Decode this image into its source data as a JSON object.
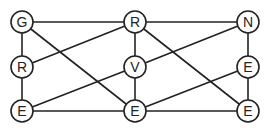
{
  "diagram": {
    "type": "graph",
    "stroke_color": "#222222",
    "background": "#ffffff",
    "node_radius": 11,
    "nodes": [
      {
        "id": "n1",
        "label": "G",
        "x": 22,
        "y": 22
      },
      {
        "id": "n2",
        "label": "R",
        "x": 135,
        "y": 22
      },
      {
        "id": "n3",
        "label": "N",
        "x": 248,
        "y": 22
      },
      {
        "id": "n4",
        "label": "R",
        "x": 22,
        "y": 67
      },
      {
        "id": "n5",
        "label": "V",
        "x": 135,
        "y": 67
      },
      {
        "id": "n6",
        "label": "E",
        "x": 248,
        "y": 67
      },
      {
        "id": "n7",
        "label": "E",
        "x": 22,
        "y": 111
      },
      {
        "id": "n8",
        "label": "E",
        "x": 135,
        "y": 111
      },
      {
        "id": "n9",
        "label": "E",
        "x": 248,
        "y": 111
      }
    ],
    "edges": [
      [
        "n1",
        "n2"
      ],
      [
        "n2",
        "n3"
      ],
      [
        "n1",
        "n4"
      ],
      [
        "n4",
        "n7"
      ],
      [
        "n2",
        "n5"
      ],
      [
        "n5",
        "n8"
      ],
      [
        "n3",
        "n6"
      ],
      [
        "n6",
        "n9"
      ],
      [
        "n7",
        "n8"
      ],
      [
        "n8",
        "n9"
      ],
      [
        "n1",
        "n8"
      ],
      [
        "n4",
        "n2"
      ],
      [
        "n7",
        "n5"
      ],
      [
        "n2",
        "n9"
      ],
      [
        "n5",
        "n3"
      ],
      [
        "n8",
        "n6"
      ]
    ]
  }
}
